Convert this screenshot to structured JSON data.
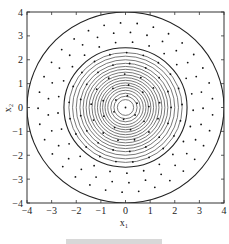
{
  "chart_data": {
    "type": "scatter",
    "title": "",
    "xlabel": "x₁",
    "ylabel": "x₂",
    "xlim": [
      -4,
      4
    ],
    "ylim": [
      -4,
      4
    ],
    "grid": false,
    "xticks": [
      -4,
      -3,
      -2,
      -1,
      0,
      1,
      2,
      3,
      4
    ],
    "yticks": [
      -4,
      -3,
      -2,
      -1,
      0,
      1,
      2,
      3,
      4
    ],
    "xtick_labels": [
      "−4",
      "−3",
      "−2",
      "−1",
      "0",
      "1",
      "2",
      "3",
      "4"
    ],
    "ytick_labels": [
      "4",
      "3",
      "2",
      "1",
      "0",
      "−1",
      "−2",
      "−3",
      "−4"
    ],
    "contours": {
      "shape": "concentric circles centered at origin",
      "radii": [
        4.0,
        2.5,
        2.3,
        2.15,
        2.0,
        1.85,
        1.72,
        1.6,
        1.48,
        1.36,
        1.25,
        1.14,
        1.03,
        0.93,
        0.83,
        0.72,
        0.6,
        0.47,
        0.33
      ]
    },
    "points": {
      "description": "sample points arranged on concentric rings within radius 4, plus one at origin",
      "rings": [
        {
          "r": 0.0,
          "count": 1
        },
        {
          "r": 0.5,
          "count": 6
        },
        {
          "r": 0.95,
          "count": 9
        },
        {
          "r": 1.4,
          "count": 13
        },
        {
          "r": 1.85,
          "count": 17
        },
        {
          "r": 2.3,
          "count": 21
        },
        {
          "r": 2.75,
          "count": 25
        },
        {
          "r": 3.15,
          "count": 29
        },
        {
          "r": 3.55,
          "count": 33
        }
      ]
    },
    "caption": ""
  },
  "figure": {
    "colors": {
      "frame": "#333333",
      "contour_outer": "#222222",
      "contour_inner": "#555555",
      "point": "#111111",
      "background": "#ffffff"
    }
  }
}
